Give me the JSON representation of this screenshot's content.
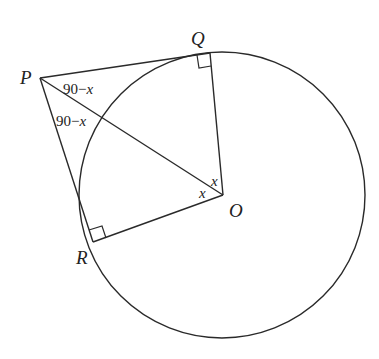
{
  "diagram": {
    "type": "geometry",
    "points": {
      "P": {
        "label": "P"
      },
      "Q": {
        "label": "Q"
      },
      "R": {
        "label": "R"
      },
      "O": {
        "label": "O"
      }
    },
    "angle_labels": {
      "QPO": "90−x",
      "RPO": "90−",
      "RPO_var": "x",
      "QPO_var": "x",
      "QOP": "x",
      "ROP": "x",
      "QPO_num": "90−"
    },
    "right_angles": [
      "PQO",
      "PRO"
    ],
    "colors": {
      "stroke": "#2a2a2a",
      "background": "#ffffff"
    }
  }
}
